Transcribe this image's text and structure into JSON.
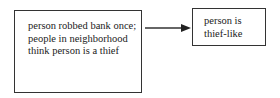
{
  "diagram": {
    "nodes": [
      {
        "id": "cause",
        "text": "person robbed bank once; people in neighborhood think person is a thief"
      },
      {
        "id": "effect",
        "text": "person is thief-like"
      }
    ],
    "edges": [
      {
        "from": "cause",
        "to": "effect",
        "type": "arrow"
      }
    ]
  }
}
